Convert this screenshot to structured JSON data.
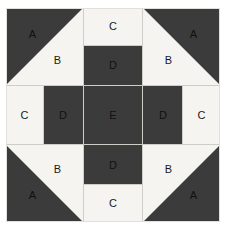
{
  "figure": {
    "name": "quilt-block-pattern",
    "background_color": "#ffffff"
  },
  "colors": {
    "dark": "#3b3b3b",
    "light": "#f5f4f0",
    "seam": "#cfcdc7",
    "label_text": "#1a1a1a",
    "block_outline": "#e2e0da"
  },
  "legend": {
    "A": "dark corner triangle",
    "B": "light corner triangle",
    "C": "light outer edge rectangle",
    "D": "dark inner edge rectangle",
    "E": "dark centre square"
  },
  "patches": {
    "corner_top_left": {
      "dark_label": "A",
      "light_label": "B"
    },
    "corner_top_right": {
      "dark_label": "A",
      "light_label": "B"
    },
    "corner_bottom_left": {
      "dark_label": "A",
      "light_label": "B"
    },
    "corner_bottom_right": {
      "dark_label": "A",
      "light_label": "B"
    },
    "edge_top": {
      "outer_label": "C",
      "inner_label": "D"
    },
    "edge_bottom": {
      "outer_label": "C",
      "inner_label": "D"
    },
    "edge_left": {
      "outer_label": "C",
      "inner_label": "D"
    },
    "edge_right": {
      "outer_label": "C",
      "inner_label": "D"
    },
    "center": {
      "label": "E"
    }
  }
}
